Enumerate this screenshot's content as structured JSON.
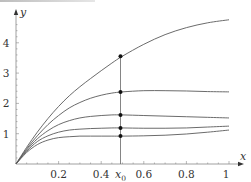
{
  "chart_data": {
    "type": "line",
    "title": "",
    "xlabel": "x",
    "ylabel": "y",
    "xlim": [
      0,
      1
    ],
    "ylim": [
      0,
      4.8
    ],
    "grid": false,
    "legend": null,
    "x_ticks": [
      {
        "value": 0.2,
        "label": "0.2"
      },
      {
        "value": 0.4,
        "label": "0.4"
      },
      {
        "value": 0.6,
        "label": "0.6"
      },
      {
        "value": 0.8,
        "label": "0.8"
      },
      {
        "value": 1.0,
        "label": "1"
      }
    ],
    "y_ticks": [
      {
        "value": 1,
        "label": "1"
      },
      {
        "value": 2,
        "label": "2"
      },
      {
        "value": 3,
        "label": "3"
      },
      {
        "value": 4,
        "label": "4"
      }
    ],
    "annotations": [
      {
        "type": "vertical-line",
        "x": 0.5,
        "label": "x0",
        "label_main": "x",
        "label_sub": "0"
      }
    ],
    "x": [
      0,
      0.05,
      0.1,
      0.15,
      0.2,
      0.25,
      0.3,
      0.35,
      0.4,
      0.45,
      0.5,
      0.6,
      0.7,
      0.8,
      0.9,
      1.0
    ],
    "series": [
      {
        "name": "curve-1",
        "values": [
          0,
          0.55,
          1.05,
          1.5,
          1.9,
          2.25,
          2.55,
          2.82,
          3.08,
          3.33,
          3.56,
          3.95,
          4.27,
          4.5,
          4.66,
          4.76
        ],
        "marker_at_x0": 3.56
      },
      {
        "name": "curve-2",
        "values": [
          0,
          0.5,
          0.93,
          1.3,
          1.6,
          1.85,
          2.03,
          2.17,
          2.27,
          2.34,
          2.38,
          2.42,
          2.42,
          2.41,
          2.39,
          2.38
        ],
        "marker_at_x0": 2.38
      },
      {
        "name": "curve-3",
        "values": [
          0,
          0.46,
          0.83,
          1.1,
          1.3,
          1.43,
          1.52,
          1.57,
          1.6,
          1.62,
          1.62,
          1.6,
          1.58,
          1.56,
          1.54,
          1.52
        ],
        "marker_at_x0": 1.62
      },
      {
        "name": "curve-4",
        "values": [
          0,
          0.42,
          0.74,
          0.93,
          1.05,
          1.12,
          1.15,
          1.17,
          1.18,
          1.19,
          1.19,
          1.18,
          1.18,
          1.19,
          1.22,
          1.25
        ],
        "marker_at_x0": 1.19
      },
      {
        "name": "curve-5",
        "values": [
          0,
          0.38,
          0.64,
          0.79,
          0.87,
          0.9,
          0.92,
          0.92,
          0.92,
          0.92,
          0.92,
          0.93,
          0.95,
          0.99,
          1.05,
          1.12
        ],
        "marker_at_x0": 0.92
      }
    ],
    "colors": {
      "curve": "#5a5a5a",
      "axis": "#888888",
      "marker": "#111111",
      "vline": "#666666"
    }
  }
}
